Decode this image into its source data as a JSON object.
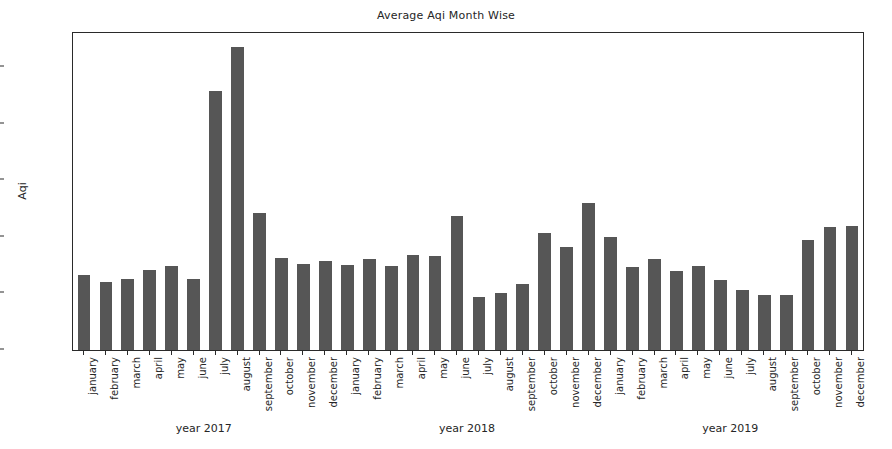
{
  "chart_data": {
    "type": "bar",
    "title": "Average Aqi Month Wise",
    "xlabel": "",
    "ylabel": "Aqi",
    "ylim": [
      0,
      560
    ],
    "yticks": [
      0,
      100,
      200,
      300,
      400,
      500
    ],
    "ytick_labels": [
      "0",
      "100",
      "200",
      "300",
      "400",
      "500"
    ],
    "grid": false,
    "legend": null,
    "bar_color": "#565656",
    "categories": [
      "january",
      "february",
      "march",
      "april",
      "may",
      "june",
      "july",
      "august",
      "september",
      "october",
      "november",
      "december",
      "january",
      "february",
      "march",
      "april",
      "may",
      "june",
      "july",
      "august",
      "september",
      "october",
      "november",
      "december",
      "january",
      "february",
      "march",
      "april",
      "may",
      "june",
      "july",
      "august",
      "september",
      "october",
      "november",
      "december"
    ],
    "values": [
      133,
      120,
      125,
      141,
      148,
      125,
      458,
      535,
      242,
      163,
      152,
      157,
      151,
      160,
      148,
      167,
      166,
      237,
      93,
      100,
      117,
      206,
      182,
      259,
      200,
      147,
      161,
      140,
      148,
      124,
      106,
      97,
      98,
      194,
      217,
      219
    ],
    "groups": [
      {
        "label": "year 2017",
        "months": [
          "january",
          "february",
          "march",
          "april",
          "may",
          "june",
          "july",
          "august",
          "september",
          "october",
          "november",
          "december"
        ],
        "values": [
          133,
          120,
          125,
          141,
          148,
          125,
          458,
          535,
          242,
          163,
          152,
          157
        ]
      },
      {
        "label": "year 2018",
        "months": [
          "january",
          "february",
          "march",
          "april",
          "may",
          "june",
          "july",
          "august",
          "september",
          "october",
          "november",
          "december"
        ],
        "values": [
          151,
          160,
          148,
          167,
          166,
          237,
          93,
          100,
          117,
          206,
          182,
          259
        ]
      },
      {
        "label": "year 2019",
        "months": [
          "january",
          "february",
          "march",
          "april",
          "may",
          "june",
          "july",
          "august",
          "september",
          "october",
          "november",
          "december"
        ],
        "values": [
          200,
          147,
          161,
          140,
          148,
          124,
          106,
          97,
          98,
          194,
          217,
          219
        ]
      }
    ]
  }
}
